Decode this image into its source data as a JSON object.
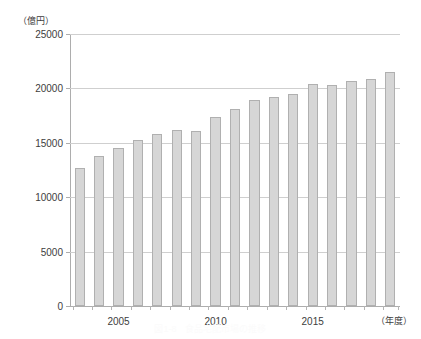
{
  "chart_data": {
    "type": "bar",
    "title": "",
    "caption": "図1-8　食品宅配市場の推移",
    "xlabel": "（年度）",
    "ylabel": "（億円）",
    "ylim": [
      0,
      25000
    ],
    "ytick_values": [
      0,
      5000,
      10000,
      15000,
      20000,
      25000
    ],
    "ytick_labels": [
      "0",
      "5000",
      "10000",
      "15000",
      "20000",
      "25000"
    ],
    "xtick_labels": [
      "2005",
      "2010",
      "2015"
    ],
    "xtick_categories": [
      2005,
      2010,
      2015
    ],
    "grid": true,
    "legend": "none",
    "bar_color": "#d6d6d6",
    "bar_edge_color": "#b0b0b0",
    "axis_color": "#adadad",
    "grid_color": "#cfcfcf",
    "categories": [
      2003,
      2004,
      2005,
      2006,
      2007,
      2008,
      2009,
      2010,
      2011,
      2012,
      2013,
      2014,
      2015,
      2016,
      2017,
      2018,
      2019
    ],
    "values": [
      12700,
      13800,
      14500,
      15300,
      15800,
      16200,
      16100,
      17400,
      18100,
      18900,
      19200,
      19500,
      20400,
      20300,
      20700,
      20900,
      21500
    ]
  }
}
